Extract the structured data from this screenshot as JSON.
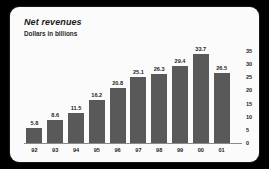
{
  "chart_data": {
    "type": "bar",
    "title": "Net revenues",
    "subtitle": "Dollars in billions",
    "xlabel": "",
    "ylabel": "",
    "categories": [
      "92",
      "93",
      "94",
      "95",
      "96",
      "97",
      "98",
      "99",
      "00",
      "01"
    ],
    "values": [
      5.8,
      8.6,
      11.5,
      16.2,
      20.8,
      25.1,
      26.3,
      29.4,
      33.7,
      26.5
    ],
    "value_labels": [
      "5.8",
      "8.6",
      "11.5",
      "16.2",
      "20.8",
      "25.1",
      "26.3",
      "29.4",
      "33.7",
      "26.5"
    ],
    "yticks": [
      0,
      5,
      10,
      15,
      20,
      25,
      30,
      35
    ],
    "ytick_labels": [
      "0",
      "5",
      "10",
      "15",
      "20",
      "25",
      "30",
      "35"
    ],
    "ylim": [
      0,
      35
    ],
    "grid": false,
    "legend": false,
    "y_axis_position": "right",
    "bar_color": "#595959",
    "panel_color": "#fbfbfb",
    "background_color": "#000000",
    "text_color": "#1f1f1f"
  }
}
